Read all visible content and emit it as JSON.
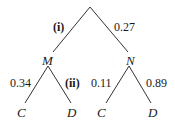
{
  "diagram": {
    "type": "probability-tree",
    "line_color": "#333333",
    "root": {
      "children": [
        {
          "label": "M",
          "branch_prob": "(i)",
          "children": [
            {
              "label": "C",
              "branch_prob": "0.34"
            },
            {
              "label": "D",
              "branch_prob": "(ii)"
            }
          ]
        },
        {
          "label": "N",
          "branch_prob": "0.27",
          "children": [
            {
              "label": "C",
              "branch_prob": "0.11"
            },
            {
              "label": "D",
              "branch_prob": "0.89"
            }
          ]
        }
      ]
    }
  }
}
